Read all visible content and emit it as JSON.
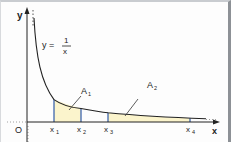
{
  "figure": {
    "function_label": {
      "lhs": "y =",
      "numerator": "1",
      "denominator": "x"
    },
    "axes": {
      "x_label": "x",
      "y_label": "y",
      "origin_label": "O"
    },
    "area_labels": [
      {
        "main": "A",
        "sub": "1"
      },
      {
        "main": "A",
        "sub": "2"
      }
    ],
    "tick_labels": [
      {
        "main": "x",
        "sub": "1"
      },
      {
        "main": "x",
        "sub": "2"
      },
      {
        "main": "x",
        "sub": "3"
      },
      {
        "main": "x",
        "sub": "4"
      }
    ],
    "colors": {
      "curve": "#222222",
      "axis": "#222222",
      "ordinate_lines": "#2f5aa8",
      "shading": "#fbf4cc",
      "border_right": "#8d9196"
    }
  }
}
